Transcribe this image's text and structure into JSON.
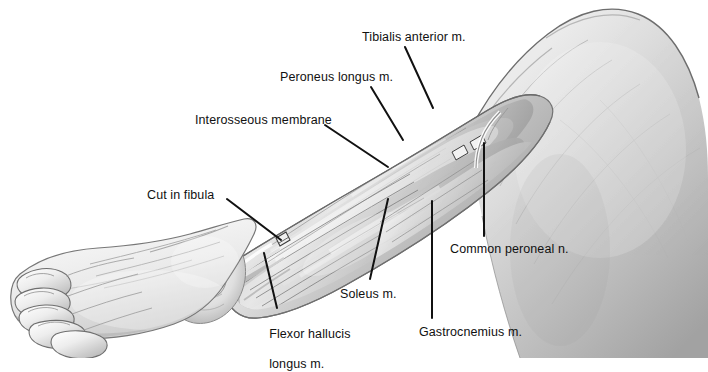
{
  "figure": {
    "background_color": "#ffffff",
    "ink_color": "#111111",
    "view": "lateral",
    "labels": [
      {
        "id": "tibialis-anterior",
        "text": "Tibialis anterior m.",
        "x": 362,
        "y": 30,
        "leader": {
          "x1": 405,
          "y1": 47,
          "x2": 433,
          "y2": 108
        }
      },
      {
        "id": "peroneus-longus",
        "text": "Peroneus longus m.",
        "x": 280,
        "y": 70,
        "leader": {
          "x1": 371,
          "y1": 87,
          "x2": 403,
          "y2": 140
        }
      },
      {
        "id": "interosseous-membrane",
        "text": "Interosseous membrane",
        "x": 195,
        "y": 113,
        "leader": {
          "x1": 325,
          "y1": 125,
          "x2": 388,
          "y2": 167
        }
      },
      {
        "id": "cut-in-fibula",
        "text": "Cut in fibula",
        "x": 147,
        "y": 188,
        "leader": {
          "x1": 227,
          "y1": 199,
          "x2": 281,
          "y2": 240
        }
      },
      {
        "id": "common-peroneal-nerve",
        "text": "Common peroneal n.",
        "x": 450,
        "y": 242,
        "leader": {
          "x1": 484,
          "y1": 236,
          "x2": 484,
          "y2": 143
        }
      },
      {
        "id": "soleus",
        "text": "Soleus m.",
        "x": 340,
        "y": 287,
        "leader": {
          "x1": 370,
          "y1": 279,
          "x2": 388,
          "y2": 199
        }
      },
      {
        "id": "flexor-hallucis-longus",
        "text": "Flexor hallucis\nlongus m.",
        "line1": "Flexor hallucis",
        "line2": "longus m.",
        "x": 262,
        "y": 312,
        "leader": {
          "x1": 277,
          "y1": 308,
          "x2": 264,
          "y2": 253
        }
      },
      {
        "id": "gastrocnemius",
        "text": "Gastrocnemius m.",
        "x": 419,
        "y": 325,
        "leader": {
          "x1": 432,
          "y1": 318,
          "x2": 432,
          "y2": 201
        }
      }
    ]
  }
}
